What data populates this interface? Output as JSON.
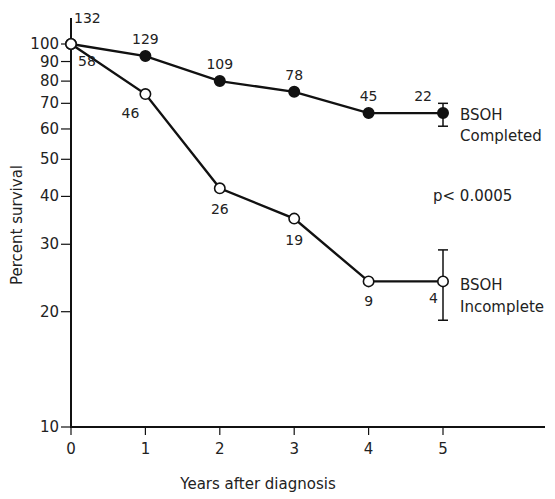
{
  "chart_data": {
    "type": "line",
    "title": "",
    "xlabel": "Years after diagnosis",
    "ylabel": "Percent survival",
    "yscale": "log",
    "ylim": [
      10,
      100
    ],
    "xlim": [
      0,
      7
    ],
    "grid": false,
    "x": [
      0,
      1,
      2,
      3,
      4,
      5
    ],
    "x_tick_labels": [
      "0",
      "1",
      "2",
      "3",
      "4",
      "5"
    ],
    "y_ticks": [
      10,
      20,
      30,
      40,
      50,
      60,
      70,
      80,
      90,
      100
    ],
    "y_tick_labels": [
      "10",
      "20",
      "30",
      "40",
      "50",
      "60",
      "70",
      "80",
      "90",
      "100"
    ],
    "series": [
      {
        "name": "BSOH Completed",
        "marker": "filled-circle",
        "values": [
          100,
          93,
          80,
          75,
          66,
          66
        ],
        "n_at_risk": [
          "132",
          "129",
          "109",
          "78",
          "45",
          "22"
        ],
        "error_bar_at_5": [
          61,
          70
        ]
      },
      {
        "name": "BSOH Incomplete",
        "marker": "open-circle",
        "values": [
          100,
          74,
          42,
          35,
          24,
          24
        ],
        "n_at_risk": [
          "58",
          "46",
          "26",
          "19",
          "9",
          "4"
        ],
        "error_bar_at_5": [
          19,
          29
        ]
      }
    ],
    "annotations": [
      "p< 0.0005"
    ],
    "legend": [
      {
        "line1": "BSOH",
        "line2": "Completed"
      },
      {
        "line1": "BSOH",
        "line2": "Incomplete"
      }
    ],
    "legend_position": "right, inline at series end"
  },
  "labels": {
    "xlabel": "Years after diagnosis",
    "ylabel": "Percent survival",
    "pvalue": "p< 0.0005",
    "legend_completed_1": "BSOH",
    "legend_completed_2": "Completed",
    "legend_incomplete_1": "BSOH",
    "legend_incomplete_2": "Incomplete"
  },
  "colors": {
    "ink": "#111111",
    "background": "#ffffff"
  }
}
